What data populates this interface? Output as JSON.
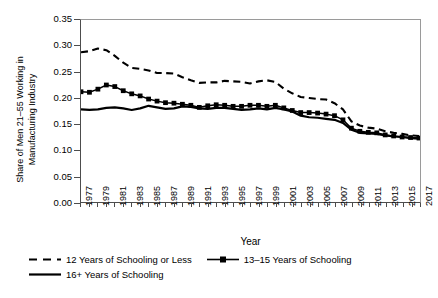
{
  "chart_data": {
    "type": "line",
    "title": "",
    "xlabel": "Year",
    "ylabel": "Share of Men 21–55 Working in\nManufacturing Industry",
    "ylim": [
      0.0,
      0.35
    ],
    "ytick_labels": [
      "0.00",
      "0.05",
      "0.10",
      "0.15",
      "0.20",
      "0.25",
      "0.30",
      "0.35"
    ],
    "ytick_values": [
      0.0,
      0.05,
      0.1,
      0.15,
      0.2,
      0.25,
      0.3,
      0.35
    ],
    "xlim": [
      1977,
      2017
    ],
    "x": [
      1977,
      1978,
      1979,
      1980,
      1981,
      1982,
      1983,
      1984,
      1985,
      1986,
      1987,
      1988,
      1989,
      1990,
      1991,
      1992,
      1993,
      1994,
      1995,
      1996,
      1997,
      1998,
      1999,
      2000,
      2001,
      2002,
      2003,
      2004,
      2005,
      2006,
      2007,
      2008,
      2009,
      2010,
      2011,
      2012,
      2013,
      2014,
      2015,
      2016,
      2017
    ],
    "xtick_labels": [
      "1977",
      "1979",
      "1981",
      "1983",
      "1985",
      "1987",
      "1989",
      "1991",
      "1993",
      "1995",
      "1997",
      "1999",
      "2001",
      "2003",
      "2005",
      "2007",
      "2009",
      "2011",
      "2013",
      "2015",
      "2017"
    ],
    "xtick_label_step": 2,
    "xtick_rotation": 90,
    "grid": false,
    "legend_position": "bottom-left",
    "series": [
      {
        "name": "12 Years of Schooling or Less",
        "style": "dashed",
        "marker": "none",
        "color": "#000000",
        "values": [
          0.288,
          0.29,
          0.295,
          0.292,
          0.281,
          0.268,
          0.258,
          0.256,
          0.253,
          0.248,
          0.248,
          0.247,
          0.24,
          0.234,
          0.229,
          0.23,
          0.23,
          0.233,
          0.232,
          0.231,
          0.228,
          0.232,
          0.234,
          0.231,
          0.218,
          0.209,
          0.202,
          0.2,
          0.198,
          0.197,
          0.19,
          0.178,
          0.155,
          0.147,
          0.143,
          0.141,
          0.136,
          0.133,
          0.131,
          0.128,
          0.127
        ]
      },
      {
        "name": "13–15 Years of Schooling",
        "style": "solid",
        "marker": "square",
        "color": "#000000",
        "values": [
          0.212,
          0.211,
          0.217,
          0.225,
          0.222,
          0.214,
          0.208,
          0.204,
          0.198,
          0.194,
          0.191,
          0.19,
          0.188,
          0.186,
          0.182,
          0.185,
          0.187,
          0.186,
          0.184,
          0.184,
          0.186,
          0.186,
          0.184,
          0.186,
          0.181,
          0.176,
          0.172,
          0.172,
          0.171,
          0.169,
          0.166,
          0.158,
          0.142,
          0.136,
          0.134,
          0.133,
          0.129,
          0.127,
          0.125,
          0.124,
          0.123
        ]
      },
      {
        "name": "16+ Years of Schooling",
        "style": "solid",
        "marker": "none",
        "color": "#000000",
        "values": [
          0.178,
          0.177,
          0.178,
          0.181,
          0.182,
          0.18,
          0.177,
          0.18,
          0.185,
          0.182,
          0.179,
          0.18,
          0.184,
          0.183,
          0.18,
          0.179,
          0.181,
          0.181,
          0.179,
          0.177,
          0.178,
          0.18,
          0.178,
          0.181,
          0.178,
          0.174,
          0.166,
          0.163,
          0.162,
          0.16,
          0.158,
          0.152,
          0.139,
          0.133,
          0.132,
          0.131,
          0.128,
          0.126,
          0.125,
          0.123,
          0.122
        ]
      }
    ]
  },
  "axis": {
    "x_title": "Year"
  },
  "legend": {
    "items": [
      {
        "label": "12 Years of Schooling or Less",
        "key": "dashed-line-key"
      },
      {
        "label": "13–15 Years of Schooling",
        "key": "square-marker-line-key"
      },
      {
        "label": "16+ Years of Schooling",
        "key": "solid-line-key"
      }
    ]
  }
}
